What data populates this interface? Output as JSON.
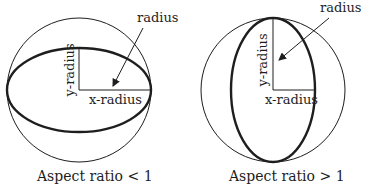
{
  "colors": {
    "background": "#ffffff",
    "ink": "#1e1e1e"
  },
  "panels": [
    {
      "id": "aspect-lt-1",
      "caption": "Aspect ratio < 1",
      "labels": {
        "radius": "radius",
        "y_radius": "y-radius",
        "x_radius": "x-radius"
      },
      "circle": {
        "cx": 79,
        "cy": 90,
        "r": 72
      },
      "ellipse": {
        "cx": 79,
        "cy": 90,
        "rx": 72,
        "ry": 42
      }
    },
    {
      "id": "aspect-gt-1",
      "caption": "Aspect ratio > 1",
      "labels": {
        "radius": "radius",
        "y_radius": "y-radius",
        "x_radius": "x-radius"
      },
      "circle": {
        "cx": 273,
        "cy": 90,
        "r": 72
      },
      "ellipse": {
        "cx": 273,
        "cy": 90,
        "rx": 42,
        "ry": 72
      }
    }
  ]
}
